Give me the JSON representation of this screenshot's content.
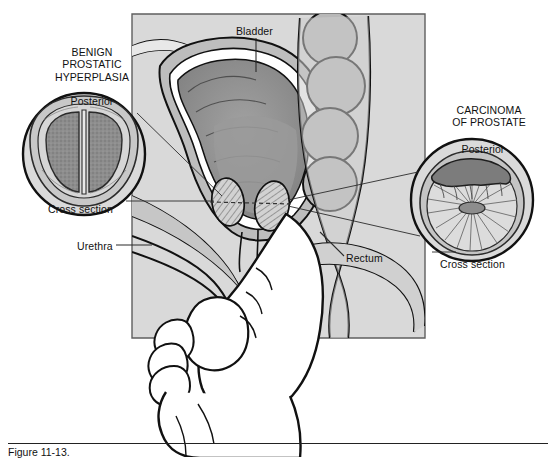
{
  "figure": {
    "caption": "Figure 11-13.",
    "panel_background": "#d9d9d9",
    "page_background": "#ffffff",
    "ink": "#111111",
    "tissue_mid": "#b4b4b4",
    "tissue_dark": "#8a8a8a",
    "tissue_light": "#e4e4e4"
  },
  "insets": {
    "bph": {
      "title": "BENIGN\nPROSTATIC\nHYPERPLASIA",
      "orientation_label": "Posterior",
      "caption": "Cross section"
    },
    "carcinoma": {
      "title": "CARCINOMA\nOF PROSTATE",
      "orientation_label": "Posterior",
      "caption": "Cross section"
    }
  },
  "anatomy_labels": {
    "bladder": "Bladder",
    "urethra": "Urethra",
    "rectum": "Rectum"
  }
}
